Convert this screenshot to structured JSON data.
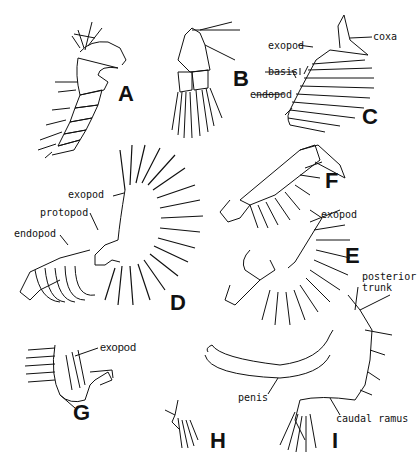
{
  "figure": {
    "panels": [
      {
        "letter": "A",
        "labels": []
      },
      {
        "letter": "B",
        "labels": []
      },
      {
        "letter": "C",
        "labels": [
          "coxa",
          "exopod",
          "basis",
          "endopod"
        ]
      },
      {
        "letter": "D",
        "labels": [
          "exopod",
          "protopod",
          "endopod"
        ]
      },
      {
        "letter": "E",
        "labels": []
      },
      {
        "letter": "F",
        "labels": []
      },
      {
        "letter": "G",
        "labels": [
          "exopod"
        ]
      },
      {
        "letter": "H",
        "labels": []
      },
      {
        "letter": "I",
        "labels": [
          "posterior trunk",
          "caudal ramus"
        ]
      }
    ],
    "shared_labels": {
      "ef_exopod": "exopod",
      "penis": "penis",
      "posterior": "posterior",
      "trunk": "trunk"
    }
  }
}
